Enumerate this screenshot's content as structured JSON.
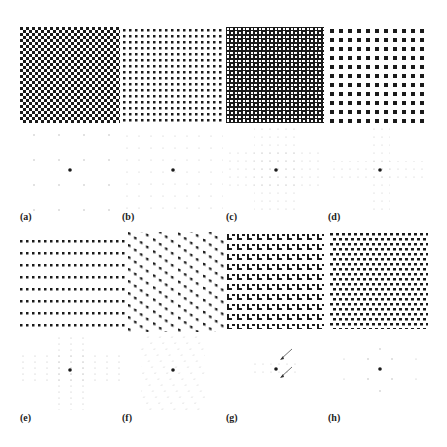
{
  "figure": {
    "panels": [
      {
        "id": "a",
        "label": "(a)",
        "pattern": "checkerboard",
        "pattern_period": 6,
        "diffraction": "sparse square lattice, period 24"
      },
      {
        "id": "b",
        "label": "(b)",
        "pattern": "square dot lattice",
        "pattern_period": 6,
        "diffraction": "square lattice, period 12"
      },
      {
        "id": "c",
        "label": "(c)",
        "pattern": "checkerboard with bars",
        "pattern_period": 12,
        "diffraction": "clustered square lattice"
      },
      {
        "id": "d",
        "label": "(d)",
        "pattern": "large square dot lattice",
        "pattern_period": 9,
        "diffraction": "cross-shaped clusters"
      },
      {
        "id": "e",
        "label": "(e)",
        "pattern": "row dot lattice",
        "pattern_period": 6,
        "diffraction": "rectangular lattice"
      },
      {
        "id": "f",
        "label": "(f)",
        "pattern": "oblique dot lattice",
        "pattern_period": 8,
        "diffraction": "oblique lattice"
      },
      {
        "id": "g",
        "label": "(g)",
        "pattern": "L-shaped motif lattice",
        "pattern_period": 10,
        "diffraction": "lattice with arrows"
      },
      {
        "id": "h",
        "label": "(h)",
        "pattern": "hexagonal dot lattice",
        "pattern_period": 6,
        "diffraction": "hexagonal lattice"
      }
    ],
    "colors": {
      "ink": "#1a1a1a",
      "faint": "#bdbdbd",
      "background": "#ffffff"
    }
  }
}
